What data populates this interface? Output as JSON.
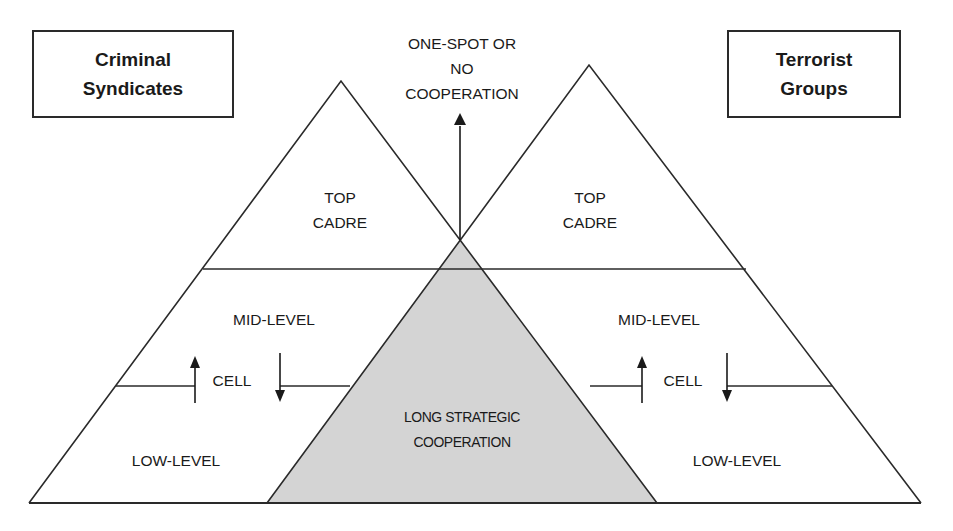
{
  "diagram": {
    "left_group": {
      "title_line1": "Criminal",
      "title_line2": "Syndicates",
      "levels": {
        "top_line1": "TOP",
        "top_line2": "CADRE",
        "mid": "MID-LEVEL",
        "cell": "CELL",
        "low": "LOW-LEVEL"
      }
    },
    "right_group": {
      "title_line1": "Terrorist",
      "title_line2": "Groups",
      "levels": {
        "top_line1": "TOP",
        "top_line2": "CADRE",
        "mid": "MID-LEVEL",
        "cell": "CELL",
        "low": "LOW-LEVEL"
      }
    },
    "top_outcome": {
      "line1": "ONE-SPOT OR",
      "line2": "NO",
      "line3": "COOPERATION"
    },
    "overlap": {
      "line1": "LONG STRATEGIC",
      "line2": "COOPERATION"
    },
    "colors": {
      "line": "#2a2a2a",
      "overlap_fill": "#d4d4d4",
      "background": "#ffffff"
    }
  }
}
